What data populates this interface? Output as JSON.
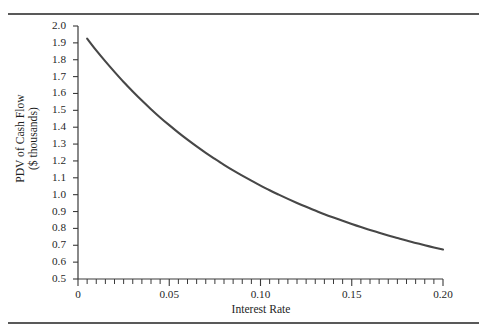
{
  "figure": {
    "top_rule": "horizontal-rule",
    "bottom_rule": "horizontal-rule"
  },
  "chart_data": {
    "type": "line",
    "title": "",
    "subtitle": "",
    "xlabel": "Interest Rate",
    "ylabel_line1": "PDV of Cash Flow",
    "ylabel_line2": "($ thousands)",
    "xlim": [
      0,
      0.2
    ],
    "ylim": [
      0.5,
      2.0
    ],
    "grid": false,
    "legend": null,
    "x_ticks_major": [
      0,
      0.05,
      0.1,
      0.15,
      0.2
    ],
    "x_tick_labels": [
      "0",
      "0.05",
      "0.10",
      "0.15",
      "0.20"
    ],
    "x_tick_minor_step": 0.005,
    "y_ticks_major": [
      0.5,
      0.6,
      0.7,
      0.8,
      0.9,
      1.0,
      1.1,
      1.2,
      1.3,
      1.4,
      1.5,
      1.6,
      1.7,
      1.8,
      1.9,
      2.0
    ],
    "y_tick_labels": [
      "0.5",
      "0.6",
      "0.7",
      "0.8",
      "0.9",
      "1.0",
      "1.1",
      "1.2",
      "1.3",
      "1.4",
      "1.5",
      "1.6",
      "1.7",
      "1.8",
      "1.9",
      "2.0"
    ],
    "series": [
      {
        "name": "PDV of Cash Flow",
        "color": "#474747",
        "x": [
          0.005,
          0.01,
          0.015,
          0.02,
          0.025,
          0.03,
          0.035,
          0.04,
          0.045,
          0.05,
          0.055,
          0.06,
          0.065,
          0.07,
          0.075,
          0.08,
          0.085,
          0.09,
          0.095,
          0.1,
          0.105,
          0.11,
          0.115,
          0.12,
          0.125,
          0.13,
          0.135,
          0.14,
          0.145,
          0.15,
          0.155,
          0.16,
          0.165,
          0.17,
          0.175,
          0.18,
          0.185,
          0.19,
          0.195,
          0.2
        ],
        "y": [
          1.925,
          1.855,
          1.79,
          1.728,
          1.668,
          1.612,
          1.558,
          1.507,
          1.458,
          1.412,
          1.368,
          1.326,
          1.286,
          1.248,
          1.212,
          1.177,
          1.144,
          1.113,
          1.083,
          1.054,
          1.026,
          1.0,
          0.975,
          0.951,
          0.928,
          0.906,
          0.884,
          0.864,
          0.845,
          0.826,
          0.808,
          0.791,
          0.774,
          0.758,
          0.743,
          0.728,
          0.714,
          0.7,
          0.687,
          0.675
        ]
      }
    ]
  },
  "axes": {
    "y_axis_name": "y-axis",
    "x_axis_name": "x-axis"
  }
}
